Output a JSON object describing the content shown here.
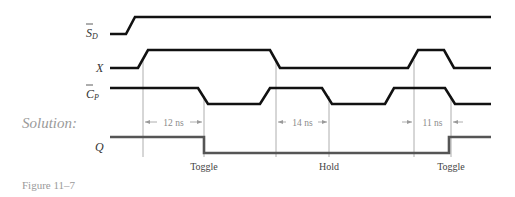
{
  "figure": {
    "caption": "Figure 11–7",
    "solution_label": "Solution:"
  },
  "signals": {
    "sd": {
      "label": "S",
      "subscript": "D",
      "overbar": true
    },
    "x": {
      "label": "X"
    },
    "cp": {
      "label": "C",
      "subscript": "P",
      "overbar": true
    },
    "q": {
      "label": "Q"
    }
  },
  "dimensions": [
    {
      "label": "12 ns",
      "from_x": 143,
      "to_x": 204
    },
    {
      "label": "14 ns",
      "from_x": 276,
      "to_x": 329
    },
    {
      "label": "11 ns",
      "from_x": 414,
      "to_x": 451
    }
  ],
  "events": [
    {
      "label": "Toggle",
      "x": 204
    },
    {
      "label": "Hold",
      "x": 329
    },
    {
      "label": "Toggle",
      "x": 451
    }
  ],
  "colors": {
    "waveform": "#111111",
    "q_waveform": "#555555",
    "guide_lines": "#9a9a9a",
    "annotation_text": "#8a8a8a"
  }
}
